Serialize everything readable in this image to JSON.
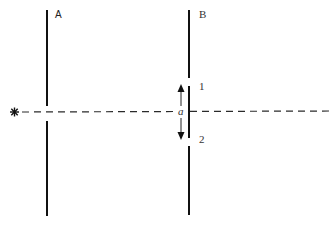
{
  "diagram": {
    "type": "double-slit-setup",
    "source": {
      "icon": "star-icon",
      "glyph": "✱"
    },
    "screens": [
      {
        "id": "A",
        "label": "A"
      },
      {
        "id": "B",
        "label": "B"
      }
    ],
    "slits": [
      {
        "id": "1",
        "label": "1"
      },
      {
        "id": "2",
        "label": "2"
      }
    ],
    "separation_label": "a",
    "colors": {
      "ink": "#1a1a1a",
      "background": "#ffffff"
    }
  }
}
